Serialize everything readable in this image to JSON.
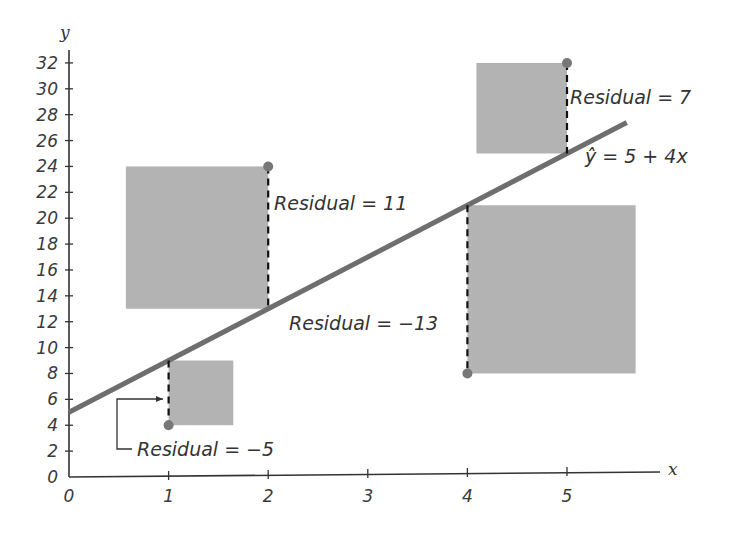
{
  "chart_data": {
    "type": "scatter",
    "title": "",
    "xlabel": "x",
    "ylabel": "y",
    "xlim": [
      0,
      5.6
    ],
    "ylim": [
      0,
      33
    ],
    "x_ticks": [
      0,
      1,
      2,
      3,
      4,
      5
    ],
    "y_ticks": [
      0,
      2,
      4,
      6,
      8,
      10,
      12,
      14,
      16,
      18,
      20,
      22,
      24,
      26,
      28,
      30,
      32
    ],
    "grid": false,
    "points": [
      {
        "x": 1,
        "y": 4,
        "residual": -5
      },
      {
        "x": 2,
        "y": 24,
        "residual": 11
      },
      {
        "x": 4,
        "y": 8,
        "residual": -13
      },
      {
        "x": 5,
        "y": 32,
        "residual": 7
      }
    ],
    "regression_line": {
      "intercept": 5,
      "slope": 4,
      "label": "ŷ = 5 + 4x",
      "x_range": [
        0,
        5.6
      ]
    },
    "annotations": [
      {
        "text": "Residual = −5",
        "point_index": 0
      },
      {
        "text": "Residual = 11",
        "point_index": 1
      },
      {
        "text": "Residual = −13",
        "point_index": 2
      },
      {
        "text": "Residual = 7",
        "point_index": 3
      }
    ],
    "squares": "Each residual is drawn as a gray square with side length |residual|"
  },
  "colors": {
    "line": "#6e6e6e",
    "square": "#b3b3b3",
    "point": "#777777",
    "axis": "#333333"
  },
  "labels": {
    "x_axis": "x",
    "y_axis": "y",
    "equation": "ŷ = 5 + 4x",
    "residual_1": "Residual = −5",
    "residual_2": "Residual = 11",
    "residual_3": "Residual = −13",
    "residual_4": "Residual = 7"
  }
}
